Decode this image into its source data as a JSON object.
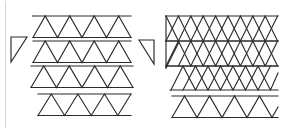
{
  "figure": {
    "canvas": {
      "width": 288,
      "height": 129,
      "background": "#ffffff"
    },
    "stroke_color": "#2b2b2b",
    "soft_stroke_color": "#6e6e6e",
    "frame_color": "#d8d8d8",
    "unit": {
      "side": 24.5,
      "height": 21.5
    },
    "frame": {
      "left_rule_x": 5,
      "top": 2,
      "bottom": 127
    },
    "groups": [
      {
        "name": "left-strip-group",
        "label": "Four horizontal triangle strips",
        "origin": {
          "x": 33,
          "y": 16
        },
        "row_pitch": 25.5,
        "rows": [
          {
            "index": 0,
            "y": 16,
            "x_start": 33,
            "up_triangles": 4,
            "down_triangles": 4,
            "top_rule": true,
            "top_rule_span": [
              33,
              131
            ],
            "bottom_rule_span": [
              33,
              131
            ]
          },
          {
            "index": 1,
            "y": 41,
            "x_start": 33,
            "up_triangles": 4,
            "down_triangles": 4,
            "top_rule": true,
            "top_rule_span": [
              33,
              131
            ],
            "bottom_rule_span": [
              33,
              131
            ]
          },
          {
            "index": 2,
            "y": 66,
            "x_start": 31,
            "up_triangles": 4,
            "down_triangles": 4,
            "top_rule": true,
            "top_rule_span": [
              31,
              133
            ],
            "bottom_rule_span": [
              31,
              133
            ]
          },
          {
            "index": 3,
            "y": 94,
            "x_start": 38,
            "up_triangles": 4,
            "down_triangles": 3,
            "top_rule": true,
            "top_rule_span": [
              38,
              131
            ],
            "bottom_rule_span": [
              38,
              131
            ]
          }
        ]
      },
      {
        "name": "right-lattice-group",
        "label": "Dense triangular lattice block with notched left edge",
        "origin": {
          "x": 166,
          "y": 16
        },
        "row_pitch": 25.5,
        "rows": [
          {
            "index": 0,
            "y": 16,
            "x_start": 166,
            "up_triangles": 5,
            "down_triangles": 4,
            "top_rule": true,
            "top_rule_span": [
              166,
              278
            ],
            "bottom_rule_span": [
              166,
              278
            ]
          },
          {
            "index": 1,
            "y": 41,
            "x_start": 166,
            "up_triangles": 5,
            "down_triangles": 4,
            "top_rule": true,
            "top_rule_span": [
              166,
              278
            ],
            "bottom_rule_span": [
              166,
              278
            ]
          },
          {
            "index": 2,
            "y": 66,
            "x_start": 166,
            "up_triangles": 5,
            "down_triangles": 4,
            "top_rule": true,
            "top_rule_span": [
              166,
              278
            ],
            "bottom_rule_span": [
              166,
              278
            ]
          },
          {
            "index": 3,
            "y": 94,
            "x_start": 172,
            "up_triangles": 4,
            "down_triangles": 3,
            "top_rule": true,
            "top_rule_span": [
              172,
              278
            ],
            "bottom_rule_span": [
              172,
              278
            ]
          }
        ],
        "left_notch": {
          "label": "vertical left edge with inward chevron",
          "x": 166,
          "y_top": 16,
          "y_bottom": 68
        }
      }
    ],
    "half_pieces": [
      {
        "name": "left-half-triangle",
        "label": "Right triangle, vertical left leg, hypotenuse top-right to bottom-left",
        "points": "11,37 27,37 11,62",
        "orientation": "left"
      },
      {
        "name": "right-half-triangle",
        "label": "Right triangle, vertical right leg, hypotenuse top-left to bottom-right",
        "points": "139,40 154,40 154,64",
        "orientation": "right"
      }
    ]
  }
}
